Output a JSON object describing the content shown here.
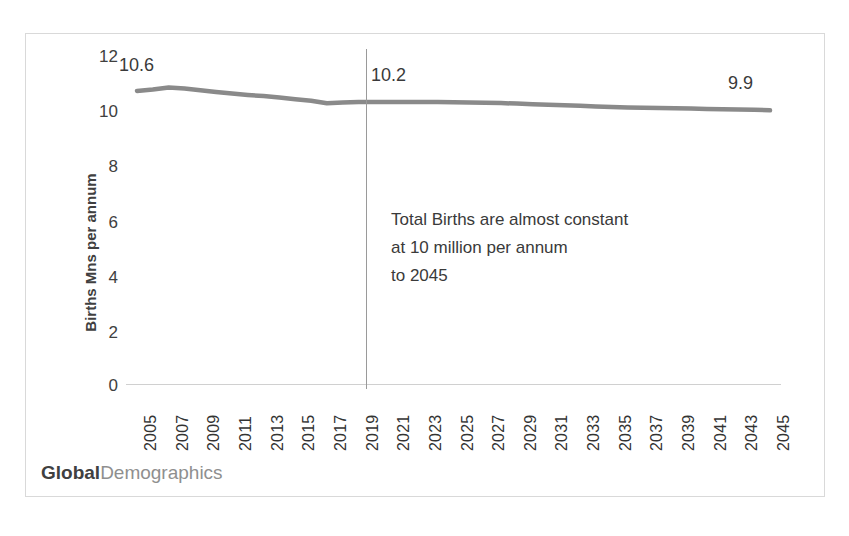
{
  "chart_data": {
    "type": "line",
    "title": "",
    "subtitle": "",
    "xlabel": "",
    "ylabel": "Births Mns per annum",
    "ylim": [
      0,
      12
    ],
    "yticks": [
      0,
      2,
      4,
      6,
      8,
      10,
      12
    ],
    "ytick_labels": [
      "0",
      "2",
      "4",
      "6",
      "8",
      "10",
      "12"
    ],
    "grid": false,
    "legend": "none",
    "x": [
      2005,
      2006,
      2007,
      2008,
      2009,
      2010,
      2011,
      2012,
      2013,
      2014,
      2015,
      2016,
      2017,
      2018,
      2019,
      2020,
      2021,
      2022,
      2023,
      2024,
      2025,
      2026,
      2027,
      2028,
      2029,
      2030,
      2031,
      2032,
      2033,
      2034,
      2035,
      2036,
      2037,
      2038,
      2039,
      2040,
      2041,
      2042,
      2043,
      2044,
      2045
    ],
    "xtick_labels": [
      "2005",
      "2007",
      "2009",
      "2011",
      "2013",
      "2015",
      "2017",
      "2019",
      "2021",
      "2023",
      "2025",
      "2027",
      "2029",
      "2031",
      "2033",
      "2035",
      "2037",
      "2039",
      "2041",
      "2043",
      "2045"
    ],
    "series": [
      {
        "name": "Total Births",
        "color": "#8a8a8a",
        "values": [
          10.6,
          10.65,
          10.72,
          10.68,
          10.62,
          10.56,
          10.5,
          10.45,
          10.41,
          10.36,
          10.3,
          10.24,
          10.15,
          10.18,
          10.2,
          10.2,
          10.2,
          10.2,
          10.2,
          10.2,
          10.19,
          10.18,
          10.17,
          10.16,
          10.14,
          10.12,
          10.1,
          10.08,
          10.06,
          10.04,
          10.02,
          10.0,
          9.99,
          9.98,
          9.97,
          9.96,
          9.95,
          9.94,
          9.93,
          9.92,
          9.9
        ]
      }
    ],
    "annotations": [
      {
        "name": "start-value",
        "text": "10.6",
        "x": 2005,
        "y": 10.6
      },
      {
        "name": "divider-value",
        "text": "10.2",
        "x": 2020,
        "y": 10.2
      },
      {
        "name": "end-value",
        "text": "9.9",
        "x": 2045,
        "y": 9.9
      }
    ],
    "divider": {
      "x": 2020,
      "label": "forecast-boundary"
    },
    "text_box": {
      "line1": "Total Births are almost constant",
      "line2": "at 10 million per annum",
      "line3": "to 2045"
    }
  },
  "axis": {
    "y_title": "Births Mns per annum",
    "y_ticks": [
      "12",
      "10",
      "8",
      "6",
      "4",
      "2",
      "0"
    ],
    "x_ticks": [
      "2005",
      "2007",
      "2009",
      "2011",
      "2013",
      "2015",
      "2017",
      "2019",
      "2021",
      "2023",
      "2025",
      "2027",
      "2029",
      "2031",
      "2033",
      "2035",
      "2037",
      "2039",
      "2041",
      "2043",
      "2045"
    ]
  },
  "callouts": {
    "start": "10.6",
    "middle": "10.2",
    "end": "9.9"
  },
  "annotation": {
    "line1": "Total Births are almost constant",
    "line2": "at 10 million per annum",
    "line3": "to 2045"
  },
  "brand": {
    "strong": "Global",
    "light": "Demographics"
  },
  "colors": {
    "series_line": "#8a8a8a",
    "divider": "#9a9a9a",
    "axis": "#d0d0d0",
    "border": "#d9d9d9",
    "text": "#3f3f3f",
    "brand_light": "#8f8f8f"
  }
}
